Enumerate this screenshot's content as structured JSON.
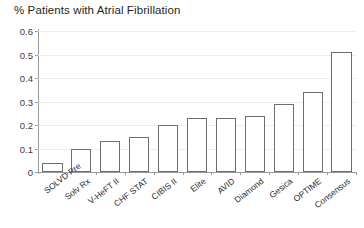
{
  "chart_data": {
    "type": "bar",
    "title": "% Patients with Atrial Fibrillation",
    "xlabel": "",
    "ylabel": "",
    "ylim": [
      0,
      0.6
    ],
    "yticks": [
      "0",
      "0.1",
      "0.2",
      "0.3",
      "0.4",
      "0.5",
      "0.6"
    ],
    "ytick_values": [
      0,
      0.1,
      0.2,
      0.3,
      0.4,
      0.5,
      0.6
    ],
    "grid": true,
    "legend": "none",
    "categories": [
      "SOLVD Pre",
      "Solv Rx",
      "V-HeFT II",
      "CHF STAT",
      "CIBIS II",
      "Elite",
      "AVID",
      "Diamond",
      "Gesica",
      "OPTIME",
      "Consensus"
    ],
    "values": [
      0.04,
      0.1,
      0.13,
      0.15,
      0.2,
      0.23,
      0.23,
      0.24,
      0.29,
      0.34,
      0.51
    ]
  },
  "style": {
    "bar_fill": "#ffffff",
    "bar_stroke": "#6e6e6e",
    "grid_color": "#ededed",
    "axis_color": "#9a9a9a",
    "background": "#ffffff",
    "text_color": "#1f1f1f"
  }
}
